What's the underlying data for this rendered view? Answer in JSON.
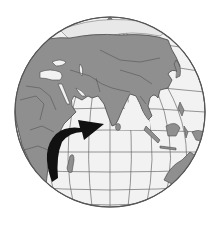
{
  "figure": {
    "type": "globe-illustration",
    "projection": "orthographic",
    "view_center": "Indian Ocean",
    "colors": {
      "background": "#ffffff",
      "ocean": "#f2f2f2",
      "land": "#8f8f8f",
      "border": "#4a4a4a",
      "graticule": "#5a5a5a",
      "arrow": "#111111",
      "ice": "#e6e6e6"
    },
    "annotation": {
      "kind": "curved-arrow",
      "from": "southeast Africa",
      "to": "south India / Sri Lanka"
    },
    "regions_visible": [
      "Europe",
      "Middle East",
      "Africa",
      "Asia",
      "India",
      "Southeast Asia",
      "Indonesia",
      "Australia",
      "Madagascar",
      "Arctic"
    ]
  }
}
